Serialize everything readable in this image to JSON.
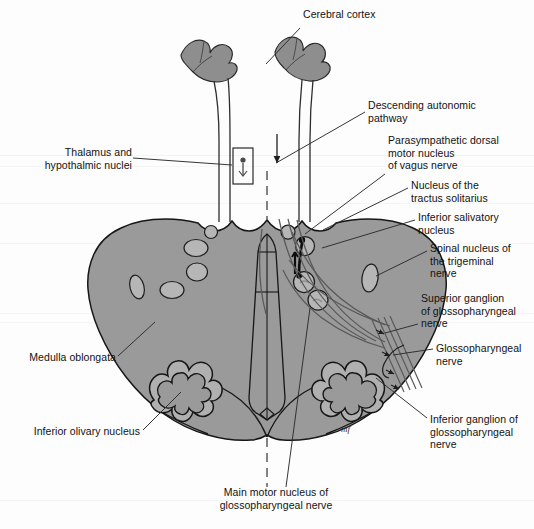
{
  "figure": {
    "width": 534,
    "height": 529,
    "signature": "mf"
  },
  "colors": {
    "background": "#fdfdfd",
    "brain_fill": "#9a9a9a",
    "nucleus_fill": "#b6b6b6",
    "olive_fill": "#b0b0b0",
    "cortex_fill": "#8e8e8e",
    "outline": "#1a1a1a",
    "text": "#121212",
    "leader": "#2b2b2b",
    "scanline": "#ececec"
  },
  "labels": [
    {
      "id": "cerebral-cortex",
      "text": "Cerebral cortex",
      "side": "right",
      "x": 303,
      "y": 14,
      "leader": {
        "x1": 300,
        "y1": 28,
        "x2": 266,
        "y2": 64
      }
    },
    {
      "id": "descending-autonomic-pathway",
      "text": "Descending autonomic\npathway",
      "side": "right",
      "x": 368,
      "y": 101,
      "leader": {
        "x1": 365,
        "y1": 112,
        "x2": 276,
        "y2": 163
      }
    },
    {
      "id": "parasympathetic-dorsal-motor-nucleus-vagus",
      "text": "Parasympathetic dorsal\nmotor nucleus\nof vagus nerve",
      "side": "right",
      "x": 388,
      "y": 136,
      "leader": {
        "x1": 385,
        "y1": 174,
        "x2": 305,
        "y2": 234
      }
    },
    {
      "id": "nucleus-of-the-tractus-solitarius",
      "text": "Nucleus of the\ntractus solitarius",
      "side": "right",
      "x": 411,
      "y": 180,
      "leader": {
        "x1": 408,
        "y1": 188,
        "x2": 323,
        "y2": 230
      }
    },
    {
      "id": "inferior-salivatory-nucleus",
      "text": "Inferior salivatory\nnucleus",
      "side": "right",
      "x": 418,
      "y": 212,
      "leader": {
        "x1": 415,
        "y1": 220,
        "x2": 322,
        "y2": 248
      }
    },
    {
      "id": "spinal-nucleus-of-the-trigeminal-nerve",
      "text": "Spinal nucleus of\nthe trigeminal\nnerve",
      "side": "right",
      "x": 430,
      "y": 243,
      "leader": {
        "x1": 427,
        "y1": 251,
        "x2": 376,
        "y2": 276
      }
    },
    {
      "id": "superior-ganglion-of-glossopharyngeal-nerve",
      "text": "Superior ganglion\nof glossopharyngeal\nnerve",
      "side": "right",
      "x": 421,
      "y": 293,
      "leader": {
        "x1": 418,
        "y1": 324,
        "x2": 385,
        "y2": 333
      }
    },
    {
      "id": "glossopharyngeal-nerve",
      "text": "Glossopharyngeal\nnerve",
      "side": "right",
      "x": 436,
      "y": 343,
      "leader": {
        "x1": 433,
        "y1": 349,
        "x2": 385,
        "y2": 358
      }
    },
    {
      "id": "inferior-ganglion-of-glossopharyngeal-nerve",
      "text": "Inferior ganglion of\nglossopharyngeal\nnerve",
      "side": "right",
      "x": 430,
      "y": 421,
      "leader": {
        "x1": 427,
        "y1": 420,
        "x2": 376,
        "y2": 380
      }
    },
    {
      "id": "thalamus-and-hypothalmic-nuclei",
      "text": "Thalamus and\nhypothalmic nuclei",
      "side": "left",
      "x": 20,
      "y": 147,
      "leader": {
        "x1": 133,
        "y1": 158,
        "x2": 232,
        "y2": 165
      }
    },
    {
      "id": "medulla-oblongata",
      "text": "Medulla oblongata",
      "side": "left",
      "x": 14,
      "y": 355,
      "leader": {
        "x1": 118,
        "y1": 356,
        "x2": 155,
        "y2": 322
      }
    },
    {
      "id": "inferior-olivary-nucleus",
      "text": "Inferior olivary nucleus",
      "side": "left",
      "x": 28,
      "y": 430,
      "leader": {
        "x1": 143,
        "y1": 430,
        "x2": 181,
        "y2": 392
      }
    },
    {
      "id": "main-motor-nucleus-of-glossopharyngeal-nerve",
      "text": "Main motor nucleus of\nglossopharyngeal nerve",
      "side": "center",
      "x": 226,
      "y": 492,
      "leader": {
        "x1": 286,
        "y1": 487,
        "x2": 308,
        "y2": 300
      }
    }
  ],
  "structures": [
    {
      "id": "medulla-oblongata-body",
      "name": "medulla-oblongata-outline"
    },
    {
      "id": "cerebral-cortex-left",
      "name": "cerebral-cortex-left-gyrus"
    },
    {
      "id": "cerebral-cortex-right",
      "name": "cerebral-cortex-right-gyrus"
    },
    {
      "id": "inferior-olivary-nucleus-left",
      "name": "inferior-olivary-nucleus-left"
    },
    {
      "id": "inferior-olivary-nucleus-right",
      "name": "inferior-olivary-nucleus-right"
    },
    {
      "id": "median-raphe",
      "name": "median-raphe-midline"
    },
    {
      "id": "fourth-ventricle",
      "name": "fourth-ventricle-outline"
    },
    {
      "id": "nucleus-tractus-solitarius-circle",
      "name": "nucleus-tractus-solitarius"
    },
    {
      "id": "dorsal-motor-nucleus-circle",
      "name": "parasympathetic-dorsal-motor-nucleus"
    },
    {
      "id": "inferior-salivatory-nucleus-circle",
      "name": "inferior-salivatory-nucleus"
    },
    {
      "id": "main-motor-nucleus-circle",
      "name": "main-motor-nucleus"
    },
    {
      "id": "spinal-trigeminal-nucleus-oval",
      "name": "spinal-nucleus-trigeminal"
    },
    {
      "id": "thalamus-box",
      "name": "thalamus-hypothalamic-nuclei-box"
    },
    {
      "id": "glossopharyngeal-fibers",
      "name": "glossopharyngeal-nerve-fiber-bundle"
    },
    {
      "id": "descending-autonomic-fiber",
      "name": "descending-autonomic-pathway-fiber"
    }
  ]
}
